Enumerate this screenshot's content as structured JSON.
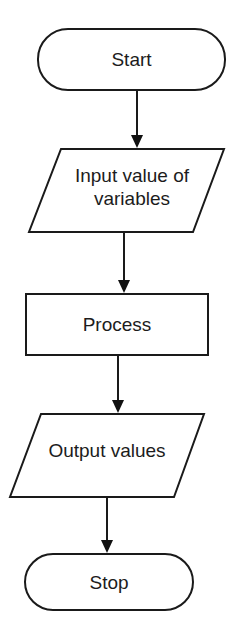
{
  "diagram": {
    "type": "flowchart",
    "direction": "top-to-bottom",
    "colors": {
      "stroke": "#1a1a1a",
      "fill": "#ffffff",
      "text": "#1c1c1c",
      "background": "#ffffff"
    },
    "nodes": [
      {
        "id": "start",
        "shape": "terminator",
        "label": "Start"
      },
      {
        "id": "input",
        "shape": "parallelogram",
        "label_line1": "Input value of",
        "label_line2": "variables"
      },
      {
        "id": "process",
        "shape": "rectangle",
        "label": "Process"
      },
      {
        "id": "output",
        "shape": "parallelogram",
        "label": "Output values"
      },
      {
        "id": "stop",
        "shape": "terminator",
        "label": "Stop"
      }
    ],
    "edges": [
      {
        "from": "start",
        "to": "input"
      },
      {
        "from": "input",
        "to": "process"
      },
      {
        "from": "process",
        "to": "output"
      },
      {
        "from": "output",
        "to": "stop"
      }
    ]
  }
}
